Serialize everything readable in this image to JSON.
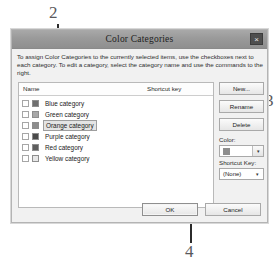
{
  "dialog": {
    "title": "Color Categories",
    "close_label": "×",
    "instructions": "To assign Color Categories to the currently selected items, use the checkboxes next to each category.  To edit a category, select the category name and use the commands to the right."
  },
  "list": {
    "columns": {
      "name": "Name",
      "shortcut": "Shortcut key"
    },
    "rows": [
      {
        "label": "Blue category",
        "checked": false,
        "swatch": "#6f6f6f",
        "selected": false,
        "shortcut": ""
      },
      {
        "label": "Green category",
        "checked": false,
        "swatch": "#a8a8a8",
        "selected": false,
        "shortcut": ""
      },
      {
        "label": "Orange category",
        "checked": false,
        "swatch": "#8d8d8d",
        "selected": true,
        "shortcut": ""
      },
      {
        "label": "Purple category",
        "checked": false,
        "swatch": "#4a4a4a",
        "selected": false,
        "shortcut": ""
      },
      {
        "label": "Red category",
        "checked": false,
        "swatch": "#5e5e5e",
        "selected": false,
        "shortcut": ""
      },
      {
        "label": "Yellow category",
        "checked": false,
        "swatch": "#e8e8e8",
        "selected": false,
        "shortcut": ""
      }
    ]
  },
  "side_panel": {
    "new_label": "New...",
    "rename_label": "Rename",
    "delete_label": "Delete",
    "color_label": "Color:",
    "color_value_swatch": "#8d8d8d",
    "shortcut_label": "Shortcut Key:",
    "shortcut_value": "(None)",
    "dropdown_arrow": "▾"
  },
  "footer": {
    "ok_label": "OK",
    "cancel_label": "Cancel"
  },
  "callouts": {
    "two": "2",
    "three": "3",
    "four": "4"
  }
}
